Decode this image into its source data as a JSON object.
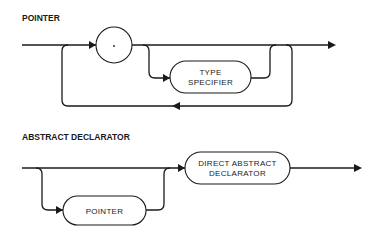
{
  "diagrams": [
    {
      "title": "POINTER",
      "nodes": [
        {
          "id": "star",
          "type": "terminal-circle",
          "label": "*"
        },
        {
          "id": "type_specifier",
          "type": "nonterminal",
          "line1": "TYPE",
          "line2": "SPECIFIER"
        }
      ],
      "paths": [
        "entry -> *",
        "* -> exit",
        "* -> TYPE SPECIFIER -> exit",
        "exit -> loop back -> *"
      ]
    },
    {
      "title": "ABSTRACT DECLARATOR",
      "nodes": [
        {
          "id": "pointer",
          "type": "nonterminal",
          "label": "POINTER"
        },
        {
          "id": "direct_abstract_declarator",
          "type": "nonterminal",
          "line1": "DIRECT ABSTRACT",
          "line2": "DECLARATOR"
        }
      ],
      "paths": [
        "entry -> DIRECT ABSTRACT DECLARATOR -> exit",
        "entry -> POINTER -> DIRECT ABSTRACT DECLARATOR"
      ]
    }
  ],
  "colors": {
    "ink": "#1a1a1a",
    "background": "#ffffff"
  }
}
